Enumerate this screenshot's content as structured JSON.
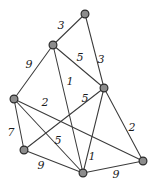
{
  "figure": {
    "background_color": "#ffffff",
    "node_fill_color": "#8c8c8c",
    "node_stroke_color": "#2b2b2b",
    "edge_color": "#3b3b3b",
    "label_color": "#1c1c1c"
  },
  "chart_data": {
    "type": "diagram",
    "title": "",
    "xlabel": "",
    "ylabel": "",
    "graph_kind": "undirected weighted graph",
    "node_count": 7,
    "edge_count": 13,
    "nodes": [
      {
        "id": "n1",
        "label": "",
        "x": 85,
        "y": 14
      },
      {
        "id": "n2",
        "label": "",
        "x": 53,
        "y": 45
      },
      {
        "id": "n3",
        "label": "",
        "x": 104,
        "y": 88
      },
      {
        "id": "n4",
        "label": "",
        "x": 14,
        "y": 99
      },
      {
        "id": "n5",
        "label": "",
        "x": 24,
        "y": 150
      },
      {
        "id": "n6",
        "label": "",
        "x": 83,
        "y": 173
      },
      {
        "id": "n7",
        "label": "",
        "x": 143,
        "y": 161
      }
    ],
    "edges": [
      {
        "source": "n2",
        "target": "n1",
        "weight": 3,
        "label_x": 61,
        "label_y": 26
      },
      {
        "source": "n2",
        "target": "n3",
        "weight": 5,
        "label_x": 80,
        "label_y": 58
      },
      {
        "source": "n1",
        "target": "n3",
        "weight": 3,
        "label_x": 101,
        "label_y": 60
      },
      {
        "source": "n2",
        "target": "n4",
        "weight": 9,
        "label_x": 29,
        "label_y": 65
      },
      {
        "source": "n2",
        "target": "n6",
        "weight": 1,
        "label_x": 70,
        "label_y": 82
      },
      {
        "source": "n3",
        "target": "n6",
        "weight": 5,
        "label_x": 85,
        "label_y": 99
      },
      {
        "source": "n4",
        "target": "n7",
        "weight": 2,
        "label_x": 45,
        "label_y": 103
      },
      {
        "source": "n4",
        "target": "n5",
        "weight": 7,
        "label_x": 11,
        "label_y": 133
      },
      {
        "source": "n4",
        "target": "n6",
        "weight": 5,
        "label_x": 58,
        "label_y": 141
      },
      {
        "source": "n5",
        "target": "n6",
        "weight": 9,
        "label_x": 41,
        "label_y": 166
      },
      {
        "source": "n3",
        "target": "n7",
        "weight": 2,
        "label_x": 132,
        "label_y": 128
      },
      {
        "source": "n5",
        "target": "n3",
        "weight": 1,
        "label_x": 92,
        "label_y": 157
      },
      {
        "source": "n6",
        "target": "n7",
        "weight": 9,
        "label_x": 116,
        "label_y": 175
      }
    ],
    "weight_labels": [
      "3",
      "5",
      "3",
      "9",
      "1",
      "5",
      "2",
      "7",
      "5",
      "9",
      "2",
      "1",
      "9"
    ]
  }
}
